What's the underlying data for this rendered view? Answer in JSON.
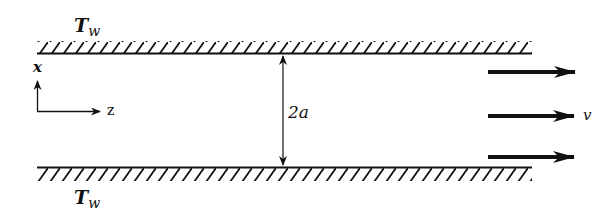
{
  "figure": {
    "top_wall": {
      "label": "T",
      "subscript": "w"
    },
    "bottom_wall": {
      "label": "T",
      "subscript": "w"
    },
    "axes": {
      "vertical": "x",
      "horizontal": "z"
    },
    "gap_dimension": "2a",
    "velocity_label": "v",
    "flow_arrows_count": 3,
    "colors": {
      "ink": "#111111",
      "background": "#ffffff"
    }
  }
}
